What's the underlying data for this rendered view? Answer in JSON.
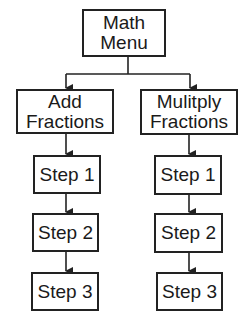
{
  "diagram": {
    "type": "flowchart",
    "root": {
      "id": "math-menu",
      "label": "Math\nMenu"
    },
    "branches": [
      {
        "id": "add-fractions",
        "label": "Add\nFractions",
        "steps": [
          {
            "id": "add-step-1",
            "label": "Step 1"
          },
          {
            "id": "add-step-2",
            "label": "Step 2"
          },
          {
            "id": "add-step-3",
            "label": "Step 3"
          }
        ]
      },
      {
        "id": "multiply-fractions",
        "label": "Mulitply\nFractions",
        "steps": [
          {
            "id": "multiply-step-1",
            "label": "Step 1"
          },
          {
            "id": "multiply-step-2",
            "label": "Step 2"
          },
          {
            "id": "multiply-step-3",
            "label": "Step 3"
          }
        ]
      }
    ],
    "edges": [
      {
        "from": "math-menu",
        "to": "add-fractions"
      },
      {
        "from": "math-menu",
        "to": "multiply-fractions"
      },
      {
        "from": "add-fractions",
        "to": "add-step-1"
      },
      {
        "from": "add-step-1",
        "to": "add-step-2"
      },
      {
        "from": "add-step-2",
        "to": "add-step-3"
      },
      {
        "from": "multiply-fractions",
        "to": "multiply-step-1"
      },
      {
        "from": "multiply-step-1",
        "to": "multiply-step-2"
      },
      {
        "from": "multiply-step-2",
        "to": "multiply-step-3"
      }
    ],
    "colors": {
      "stroke": "#222222",
      "fill": "#ffffff",
      "text": "#1a1a1a"
    }
  }
}
